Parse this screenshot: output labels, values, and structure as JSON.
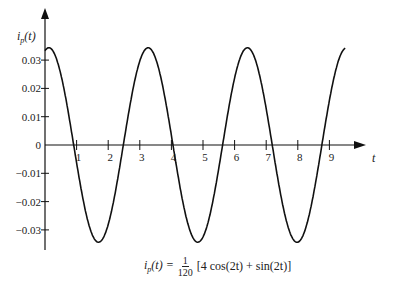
{
  "chart_data": {
    "type": "line",
    "title": "",
    "xlabel": "t",
    "ylabel": "i_p(t)",
    "ylabel_display": {
      "base": "i",
      "sub": "p",
      "arg": "(t)"
    },
    "x_ticks": [
      1,
      2,
      3,
      4,
      5,
      6,
      7,
      8,
      9
    ],
    "x_tick_labels": [
      "1",
      "2",
      "3",
      "4",
      "5",
      "6",
      "7",
      "8",
      "9"
    ],
    "y_ticks": [
      0.03,
      0.02,
      0.01,
      0,
      -0.01,
      -0.02,
      -0.03
    ],
    "y_tick_labels": [
      "0.03",
      "0.02",
      "0.01",
      "0",
      "-0.01",
      "-0.02",
      "-0.03"
    ],
    "xlim": [
      0,
      9.5
    ],
    "ylim": [
      -0.045,
      0.04
    ],
    "grid": false,
    "legend": null,
    "function": "i_p(t) = (1/120) [4 cos(2t) + sin(2t)]",
    "amplitude": 0.0344,
    "series": [
      {
        "name": "i_p(t)",
        "x": [
          0,
          0.12,
          0.5,
          0.84,
          1,
          1.5,
          1.69,
          2,
          2.41,
          2.5,
          3,
          3.26,
          3.5,
          3.98,
          4,
          4.5,
          4.83,
          5,
          5.5,
          5.55,
          6,
          6.4,
          6.5,
          7,
          7.12,
          7.5,
          7.97,
          8,
          8.5,
          8.69,
          9,
          9.4
        ],
        "y": [
          0.0333,
          0.0344,
          0.025,
          0.0,
          -0.0063,
          -0.0318,
          -0.0344,
          -0.0289,
          -0.0,
          0.0049,
          0.0297,
          0.0344,
          0.03,
          0.0,
          -0.0002,
          -0.0308,
          -0.0344,
          -0.0313,
          -0.0054,
          0.0,
          0.029,
          0.0344,
          0.0337,
          0.0095,
          0.0,
          -0.02,
          -0.0344,
          -0.0343,
          -0.0274,
          0.0,
          0.0214,
          0.033
        ]
      }
    ],
    "annotations": [
      {
        "text": "i_p(t) = 1/120 [4 cos(2t) + sin(2t)]",
        "position": "bottom-center"
      }
    ]
  },
  "formula": {
    "lhs_base": "i",
    "lhs_sub": "p",
    "lhs_arg": "(t) =",
    "frac_num": "1",
    "frac_den": "120",
    "rhs": "[4 cos(2t) + sin(2t)]"
  },
  "layout": {
    "origin_px": [
      45,
      145
    ],
    "px_per_x_unit": 31.6,
    "px_per_y_unit": 2830,
    "line_color": "#111111"
  }
}
